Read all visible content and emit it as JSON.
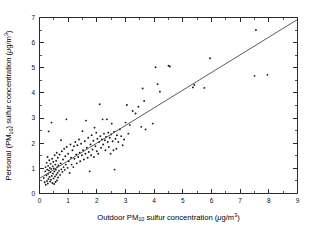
{
  "figure": {
    "background_color": "#ffffff",
    "point_color": "#1a1a1a",
    "line_color": "#4a4a4a",
    "axis_color": "#2b2b2b"
  },
  "axes": {
    "x_title_parts": {
      "pre": "Outdoor PM",
      "sub": "10",
      "mid": " sulfur concentration (",
      "unit_mu": "μ",
      "unit_rest": "g/m",
      "unit_sup": "3",
      "post": ")"
    },
    "y_title_parts": {
      "pre": "Personal (PM",
      "sub": "10",
      "mid": ") sulfur concentration (",
      "unit_mu": "μ",
      "unit_rest": "g/m",
      "unit_sup": "3",
      "post": ")"
    },
    "x_title_plain": "Outdoor PM10 sulfur concentration (μg/m3)",
    "y_title_plain": "Personal (PM10) sulfur concentration (μg/m3)",
    "x_ticklabels": [
      "0",
      "1",
      "2",
      "3",
      "4",
      "5",
      "6",
      "7",
      "8",
      "9"
    ],
    "y_ticklabels": [
      "0",
      "1",
      "2",
      "3",
      "4",
      "5",
      "6",
      "7"
    ]
  },
  "chart_data": {
    "type": "scatter",
    "title": "",
    "xlabel": "Outdoor PM10 sulfur concentration (μg/m3)",
    "ylabel": "Personal (PM10) sulfur concentration (μg/m3)",
    "xlim": [
      0,
      9
    ],
    "ylim": [
      0,
      7
    ],
    "xticks": [
      0,
      1,
      2,
      3,
      4,
      5,
      6,
      7,
      8,
      9
    ],
    "yticks": [
      0,
      1,
      2,
      3,
      4,
      5,
      6,
      7
    ],
    "minor_ticks": true,
    "grid": false,
    "legend": null,
    "series": [
      {
        "name": "Personal vs outdoor sulfur",
        "marker": "dot",
        "points": [
          [
            0.15,
            0.62
          ],
          [
            0.18,
            0.45
          ],
          [
            0.2,
            0.88
          ],
          [
            0.21,
            1.05
          ],
          [
            0.22,
            0.35
          ],
          [
            0.24,
            0.72
          ],
          [
            0.25,
            1.22
          ],
          [
            0.26,
            0.5
          ],
          [
            0.27,
            0.95
          ],
          [
            0.28,
            1.45
          ],
          [
            0.29,
            0.4
          ],
          [
            0.3,
            0.78
          ],
          [
            0.3,
            1.1
          ],
          [
            0.31,
            0.58
          ],
          [
            0.32,
            2.47
          ],
          [
            0.33,
            0.92
          ],
          [
            0.34,
            1.32
          ],
          [
            0.35,
            0.66
          ],
          [
            0.36,
            1.02
          ],
          [
            0.37,
            0.48
          ],
          [
            0.38,
            0.85
          ],
          [
            0.39,
            1.18
          ],
          [
            0.4,
            0.55
          ],
          [
            0.41,
            0.98
          ],
          [
            0.42,
            2.82
          ],
          [
            0.43,
            0.7
          ],
          [
            0.44,
            1.38
          ],
          [
            0.45,
            0.42
          ],
          [
            0.46,
            1.08
          ],
          [
            0.47,
            0.8
          ],
          [
            0.48,
            1.25
          ],
          [
            0.49,
            0.6
          ],
          [
            0.5,
            1.0
          ],
          [
            0.51,
            0.38
          ],
          [
            0.52,
            0.88
          ],
          [
            0.53,
            1.52
          ],
          [
            0.54,
            0.68
          ],
          [
            0.55,
            1.15
          ],
          [
            0.56,
            0.46
          ],
          [
            0.57,
            0.95
          ],
          [
            0.58,
            1.3
          ],
          [
            0.59,
            0.75
          ],
          [
            0.6,
            1.62
          ],
          [
            0.61,
            0.52
          ],
          [
            0.62,
            1.05
          ],
          [
            0.63,
            0.82
          ],
          [
            0.64,
            1.42
          ],
          [
            0.65,
            0.64
          ],
          [
            0.66,
            1.12
          ],
          [
            0.68,
            0.9
          ],
          [
            0.7,
            1.55
          ],
          [
            0.72,
            0.74
          ],
          [
            0.74,
            1.2
          ],
          [
            0.75,
            2.12
          ],
          [
            0.76,
            0.96
          ],
          [
            0.78,
            1.68
          ],
          [
            0.8,
            0.86
          ],
          [
            0.82,
            1.35
          ],
          [
            0.84,
            1.05
          ],
          [
            0.86,
            1.78
          ],
          [
            0.88,
            0.94
          ],
          [
            0.9,
            1.48
          ],
          [
            0.92,
            1.15
          ],
          [
            0.94,
            2.95
          ],
          [
            0.95,
            1.85
          ],
          [
            0.98,
            1.02
          ],
          [
            1.0,
            1.58
          ],
          [
            1.02,
            1.28
          ],
          [
            1.05,
            0.82
          ],
          [
            1.08,
            1.95
          ],
          [
            1.1,
            1.42
          ],
          [
            1.12,
            1.15
          ],
          [
            1.15,
            1.72
          ],
          [
            1.18,
            1.05
          ],
          [
            1.2,
            1.88
          ],
          [
            1.22,
            1.38
          ],
          [
            1.25,
            2.05
          ],
          [
            1.28,
            1.55
          ],
          [
            1.3,
            1.2
          ],
          [
            1.32,
            1.92
          ],
          [
            1.35,
            1.45
          ],
          [
            1.38,
            2.15
          ],
          [
            1.4,
            1.62
          ],
          [
            1.42,
            1.28
          ],
          [
            1.45,
            1.98
          ],
          [
            1.48,
            1.52
          ],
          [
            1.5,
            2.48
          ],
          [
            1.52,
            1.72
          ],
          [
            1.55,
            1.35
          ],
          [
            1.58,
            2.08
          ],
          [
            1.6,
            1.58
          ],
          [
            1.62,
            2.9
          ],
          [
            1.65,
            1.82
          ],
          [
            1.68,
            1.42
          ],
          [
            1.7,
            2.22
          ],
          [
            1.72,
            1.65
          ],
          [
            1.75,
            0.88
          ],
          [
            1.78,
            1.95
          ],
          [
            1.8,
            1.52
          ],
          [
            1.82,
            2.32
          ],
          [
            1.85,
            1.75
          ],
          [
            1.88,
            2.1
          ],
          [
            1.9,
            1.45
          ],
          [
            1.92,
            2.62
          ],
          [
            1.95,
            1.88
          ],
          [
            1.98,
            2.42
          ],
          [
            2.0,
            1.68
          ],
          [
            2.02,
            2.18
          ],
          [
            2.05,
            1.58
          ],
          [
            2.08,
            2.05
          ],
          [
            2.1,
            3.55
          ],
          [
            2.12,
            2.28
          ],
          [
            2.15,
            1.82
          ],
          [
            2.18,
            2.15
          ],
          [
            2.2,
            2.95
          ],
          [
            2.22,
            1.95
          ],
          [
            2.25,
            2.38
          ],
          [
            2.28,
            2.12
          ],
          [
            2.3,
            1.72
          ],
          [
            2.32,
            2.25
          ],
          [
            2.35,
            2.95
          ],
          [
            2.38,
            2.05
          ],
          [
            2.4,
            2.42
          ],
          [
            2.42,
            1.85
          ],
          [
            2.45,
            2.22
          ],
          [
            2.48,
            1.58
          ],
          [
            2.5,
            2.35
          ],
          [
            2.52,
            2.78
          ],
          [
            2.55,
            2.08
          ],
          [
            2.58,
            1.72
          ],
          [
            2.6,
            2.45
          ],
          [
            2.62,
            0.95
          ],
          [
            2.65,
            2.18
          ],
          [
            2.68,
            1.78
          ],
          [
            2.7,
            2.32
          ],
          [
            2.75,
            2.05
          ],
          [
            2.8,
            2.55
          ],
          [
            2.85,
            2.28
          ],
          [
            2.9,
            1.92
          ],
          [
            2.95,
            2.15
          ],
          [
            3.0,
            2.82
          ],
          [
            3.05,
            3.52
          ],
          [
            3.1,
            2.38
          ],
          [
            3.15,
            2.72
          ],
          [
            3.25,
            3.28
          ],
          [
            3.35,
            3.18
          ],
          [
            3.45,
            3.45
          ],
          [
            3.55,
            2.65
          ],
          [
            3.6,
            4.18
          ],
          [
            3.65,
            3.68
          ],
          [
            3.7,
            2.55
          ],
          [
            3.95,
            2.78
          ],
          [
            4.05,
            5.02
          ],
          [
            4.12,
            4.35
          ],
          [
            4.2,
            4.05
          ],
          [
            4.5,
            5.08
          ],
          [
            4.55,
            5.05
          ],
          [
            5.35,
            4.22
          ],
          [
            5.4,
            4.32
          ],
          [
            5.75,
            4.2
          ],
          [
            5.95,
            5.38
          ],
          [
            7.5,
            4.68
          ],
          [
            7.55,
            6.5
          ],
          [
            7.95,
            4.72
          ]
        ]
      }
    ],
    "fit_line": {
      "name": "regression line",
      "x0": 0.0,
      "y0": 0.6,
      "x1": 9.0,
      "y1": 6.92
    }
  }
}
